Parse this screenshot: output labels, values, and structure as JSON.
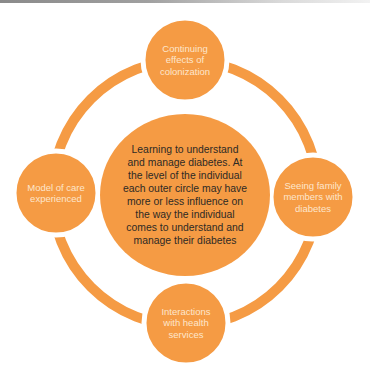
{
  "diagram": {
    "type": "hub-and-ring",
    "colors": {
      "fill": "#F59B44",
      "ring": "#F59B44",
      "outer_text": "#FDE6CC",
      "center_text": "#2E2A25",
      "background": "#FFFFFF"
    },
    "center": {
      "label": "Learning to understand\nand manage diabetes. At\nthe level of the individual\neach outer circle may have\nmore or less influence on\nthe way the individual\ncomes to understand and\nmanage their diabetes"
    },
    "nodes": {
      "top": {
        "label": "Continuing\neffects of\ncolonization"
      },
      "right": {
        "label": "Seeing family\nmembers with\ndiabetes"
      },
      "bottom": {
        "label": "Interactions\nwith health\nservices"
      },
      "left": {
        "label": "Model of care\nexperienced"
      }
    }
  }
}
